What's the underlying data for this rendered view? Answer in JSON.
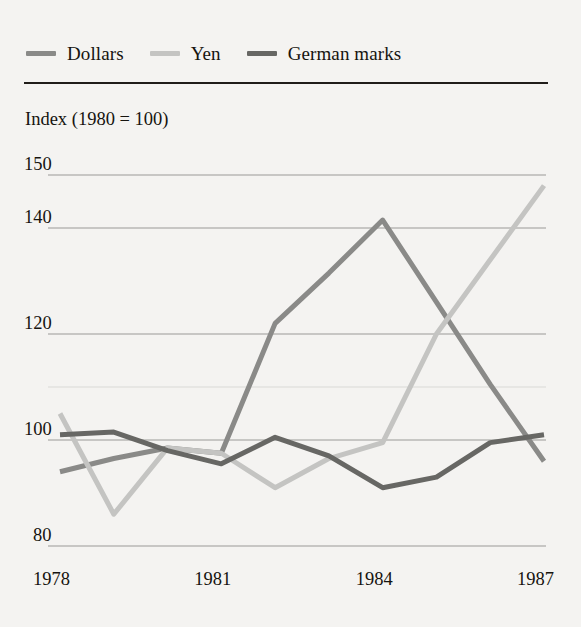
{
  "legend": {
    "items": [
      {
        "label": "Dollars",
        "color": "#8a8a88"
      },
      {
        "label": "Yen",
        "color": "#c4c4c2"
      },
      {
        "label": "German marks",
        "color": "#676764"
      }
    ]
  },
  "axis_title": "Index (1980 = 100)",
  "y_ticks": [
    "150",
    "140",
    "120",
    "100",
    "80"
  ],
  "x_ticks": [
    "1978",
    "1981",
    "1984",
    "1987"
  ],
  "colors": {
    "background": "#f4f3f1",
    "rule": "#201d19",
    "gridline": "#9a9a97",
    "text": "#16140f"
  },
  "chart_data": {
    "type": "line",
    "title": "Index (1980 = 100)",
    "xlabel": "",
    "ylabel": "Index (1980 = 100)",
    "x": [
      1978,
      1979,
      1980,
      1981,
      1982,
      1983,
      1984,
      1985,
      1986,
      1987
    ],
    "xlim": [
      1978,
      1987
    ],
    "ylim": [
      80,
      150
    ],
    "yticks": [
      80,
      100,
      120,
      140,
      150
    ],
    "grid": true,
    "legend_position": "top-left",
    "series": [
      {
        "name": "Dollars",
        "color": "#8a8a88",
        "values": [
          94,
          96.5,
          98.5,
          97.5,
          122,
          131.5,
          141.5,
          126,
          110.5,
          96
        ]
      },
      {
        "name": "Yen",
        "color": "#c4c4c2",
        "values": [
          105,
          86,
          98.5,
          97.5,
          91,
          96.5,
          99.5,
          120,
          134,
          148
        ]
      },
      {
        "name": "German marks",
        "color": "#676764",
        "values": [
          101,
          101.5,
          98,
          95.5,
          100.5,
          97,
          91,
          93,
          99.5,
          101
        ]
      }
    ]
  }
}
